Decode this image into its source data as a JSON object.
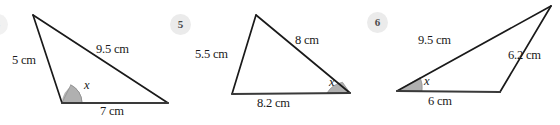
{
  "page": {
    "background_color": "#ffffff",
    "ink_color": "#1a1a1a",
    "badge_fill": "#ebebeb",
    "angle_fill": "#b3b3b3",
    "angle_stroke": "#808080"
  },
  "partial_badge": {
    "label": "4",
    "visible": "clipped-at-left-edge"
  },
  "questions": [
    {
      "number": "",
      "name": "triangle-question-4",
      "angle_label": "x",
      "sides": [
        {
          "name": "side-left",
          "label": "5 cm"
        },
        {
          "name": "side-hypotenuse",
          "label": "9.5 cm"
        },
        {
          "name": "side-base",
          "label": "7 cm"
        }
      ]
    },
    {
      "number": "5",
      "name": "triangle-question-5",
      "angle_label": "x",
      "sides": [
        {
          "name": "side-left",
          "label": "5.5 cm"
        },
        {
          "name": "side-upper-right",
          "label": "8 cm"
        },
        {
          "name": "side-base",
          "label": "8.2 cm"
        }
      ]
    },
    {
      "number": "6",
      "name": "triangle-question-6",
      "angle_label": "x",
      "sides": [
        {
          "name": "side-upper-left",
          "label": "9.5 cm"
        },
        {
          "name": "side-right",
          "label": "6.2 cm"
        },
        {
          "name": "side-base",
          "label": "6 cm"
        }
      ]
    }
  ]
}
